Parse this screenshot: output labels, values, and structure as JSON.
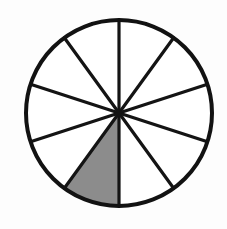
{
  "figure": {
    "kind": "fraction-circle-diagram",
    "title": "Circle divided into ten equal sectors with one sector shaded",
    "background_color": "#fdfdfd",
    "canvas": {
      "width": 227,
      "height": 229
    }
  },
  "chart_data": {
    "type": "pie",
    "title": "Circle divided into ten equal sectors with one sector shaded",
    "xlabel": "",
    "ylabel": "",
    "grid": false,
    "legend": false,
    "legend_position": "none",
    "total_sectors": 10,
    "shaded_sectors": 1,
    "fraction_shaded": "1/10",
    "percent_shaded": 10,
    "sector_angle_degrees": 36,
    "categories": [
      "sector-1",
      "sector-2",
      "sector-3",
      "sector-4",
      "sector-5",
      "sector-6",
      "sector-7",
      "sector-8",
      "sector-9",
      "sector-10"
    ],
    "values": [
      10,
      10,
      10,
      10,
      10,
      10,
      10,
      10,
      10,
      10
    ],
    "slice_colors": [
      "#ffffff",
      "#ffffff",
      "#ffffff",
      "#ffffff",
      "#ffffff",
      "#8c8c8c",
      "#ffffff",
      "#ffffff",
      "#ffffff",
      "#ffffff"
    ],
    "shaded_index": 5,
    "annotations": []
  },
  "geometry": {
    "center_x": 119,
    "center_y": 113,
    "radius": 93,
    "outline_color": "#121212",
    "outline_width": 4,
    "spoke_color": "#141414",
    "spoke_width": 3.2,
    "fill_shaded": "#8c8c8c",
    "fill_unshaded": "#ffffff",
    "start_angle_degrees": -90,
    "sector_start_degrees": [
      -90,
      -54,
      -18,
      18,
      54,
      90,
      126,
      162,
      198,
      234
    ],
    "spoke_endpoints": [
      {
        "name": "spoke-top",
        "angle": -90,
        "x": 119,
        "y": 20
      },
      {
        "name": "spoke-upper-right",
        "angle": -54,
        "x": 174,
        "y": 38
      },
      {
        "name": "spoke-right-upper",
        "angle": -18,
        "x": 207,
        "y": 84
      },
      {
        "name": "spoke-right-lower",
        "angle": 18,
        "x": 207,
        "y": 142
      },
      {
        "name": "spoke-lower-right",
        "angle": 54,
        "x": 174,
        "y": 188
      },
      {
        "name": "spoke-bottom",
        "angle": 90,
        "x": 119,
        "y": 206
      },
      {
        "name": "spoke-lower-left",
        "angle": 126,
        "x": 64,
        "y": 188
      },
      {
        "name": "spoke-left-lower",
        "angle": 162,
        "x": 31,
        "y": 142
      },
      {
        "name": "spoke-left-upper",
        "angle": 198,
        "x": 31,
        "y": 84
      },
      {
        "name": "spoke-upper-left",
        "angle": 234,
        "x": 64,
        "y": 38
      }
    ]
  }
}
